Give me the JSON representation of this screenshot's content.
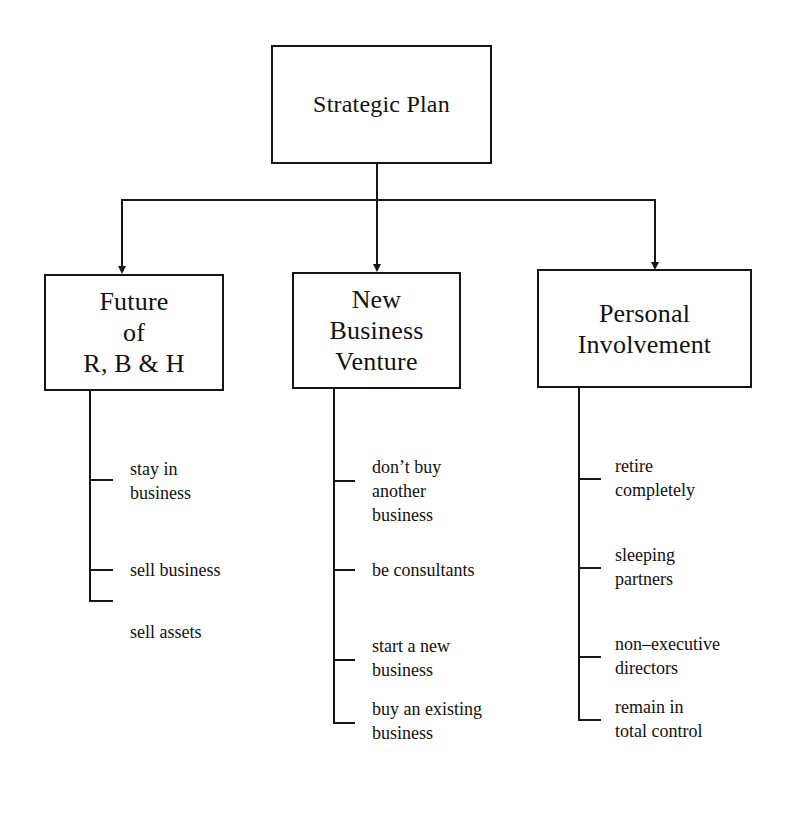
{
  "diagram": {
    "root": {
      "label": "Strategic Plan"
    },
    "branches": [
      {
        "label": "Future\nof\nR, B & H",
        "options": [
          {
            "label": "stay in\nbusiness"
          },
          {
            "label": "sell business"
          },
          {
            "label": "sell assets"
          }
        ]
      },
      {
        "label": "New\nBusiness\nVenture",
        "options": [
          {
            "label": "don’t buy\nanother\nbusiness"
          },
          {
            "label": "be consultants"
          },
          {
            "label": "start a new\nbusiness"
          },
          {
            "label": "buy an existing\nbusiness"
          }
        ]
      },
      {
        "label": "Personal\nInvolvement",
        "options": [
          {
            "label": "retire\ncompletely"
          },
          {
            "label": "sleeping\npartners"
          },
          {
            "label": "non–executive\ndirectors"
          },
          {
            "label": "remain in\ntotal control"
          }
        ]
      }
    ],
    "colors": {
      "line": "#161616",
      "background": "#ffffff",
      "text": "#111111"
    }
  }
}
